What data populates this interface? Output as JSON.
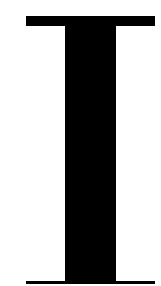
{
  "glyph": {
    "character": "I",
    "description": "I-beam / text cursor glyph",
    "color": "#000000",
    "background": "#ffffff"
  }
}
